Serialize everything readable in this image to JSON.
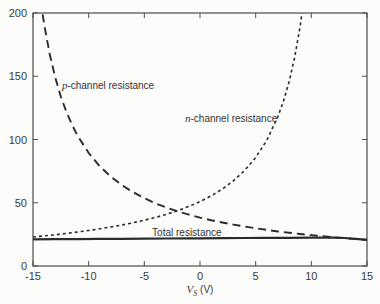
{
  "figure": {
    "background": "#fcfcfb",
    "curve_color": "#2b2b2b",
    "axis_color": "#4d4d4d",
    "text_color": "#3a3a3a"
  },
  "chart_data": {
    "type": "line",
    "title": "",
    "xlabel": "V_S (V)",
    "xlabel_parts": {
      "var": "V",
      "sub": "S",
      "unit": " (V)"
    },
    "ylabel": "",
    "xlim": [
      -15,
      15
    ],
    "ylim": [
      0,
      200
    ],
    "xticks": [
      -15,
      -10,
      -5,
      0,
      5,
      10,
      15
    ],
    "xtick_labels": [
      "-15",
      "-10",
      "-5",
      "0",
      "5",
      "10",
      "15"
    ],
    "yticks": [
      0,
      50,
      100,
      150,
      200
    ],
    "ytick_labels": [
      "0",
      "50",
      "100",
      "150",
      "200"
    ],
    "grid": false,
    "legend": "inline-annotations",
    "tick_direction": "in",
    "mirrored_ticks": true,
    "series": [
      {
        "id": "p-channel-curve",
        "label": "p-channel resistance",
        "line_style": "long-dash",
        "dash": "8 5",
        "stroke_width": 1.9,
        "points": [
          [
            -14.3,
            209
          ],
          [
            -14,
            191.4
          ],
          [
            -13.5,
            167.5
          ],
          [
            -13,
            148.9
          ],
          [
            -12.5,
            134
          ],
          [
            -12,
            121.8
          ],
          [
            -11.5,
            111.7
          ],
          [
            -11,
            103.1
          ],
          [
            -10,
            89.3
          ],
          [
            -9,
            78.8
          ],
          [
            -8,
            70.5
          ],
          [
            -7,
            63.8
          ],
          [
            -6,
            58.3
          ],
          [
            -5,
            53.6
          ],
          [
            -4,
            49.6
          ],
          [
            -3,
            46.2
          ],
          [
            -2,
            43.2
          ],
          [
            -1,
            40.6
          ],
          [
            0,
            38.3
          ],
          [
            1,
            36.2
          ],
          [
            2,
            34.4
          ],
          [
            3,
            32.7
          ],
          [
            4,
            31.2
          ],
          [
            5,
            29.8
          ],
          [
            6,
            28.5
          ],
          [
            7,
            27.3
          ],
          [
            8,
            26.3
          ],
          [
            9,
            25.3
          ],
          [
            10,
            24.4
          ],
          [
            11,
            23.5
          ],
          [
            12,
            22.7
          ],
          [
            13,
            22.0
          ],
          [
            14,
            21.3
          ],
          [
            15,
            20.6
          ]
        ]
      },
      {
        "id": "n-channel-curve",
        "label": "n-channel resistance",
        "line_style": "short-dash",
        "dash": "3 3",
        "stroke_width": 1.6,
        "points": [
          [
            -15,
            22.9
          ],
          [
            -14,
            23.8
          ],
          [
            -13,
            24.7
          ],
          [
            -12,
            25.8
          ],
          [
            -11,
            26.9
          ],
          [
            -10,
            28.1
          ],
          [
            -9,
            29.4
          ],
          [
            -8,
            30.8
          ],
          [
            -7,
            32.4
          ],
          [
            -6,
            34.2
          ],
          [
            -5,
            36.2
          ],
          [
            -4,
            38.4
          ],
          [
            -3,
            40.9
          ],
          [
            -2,
            43.8
          ],
          [
            -1,
            47.1
          ],
          [
            0,
            50.9
          ],
          [
            1,
            55.4
          ],
          [
            2,
            60.8
          ],
          [
            3,
            67.3
          ],
          [
            4,
            75.4
          ],
          [
            5,
            85.8
          ],
          [
            6,
            99.4
          ],
          [
            7,
            118.1
          ],
          [
            7.5,
            130.4
          ],
          [
            8,
            145.6
          ],
          [
            8.5,
            164.7
          ],
          [
            9,
            189.7
          ],
          [
            9.4,
            215.9
          ]
        ]
      },
      {
        "id": "total-curve",
        "label": "Total resistance",
        "line_style": "solid",
        "dash": "",
        "stroke_width": 2.2,
        "points": [
          [
            -15,
            21.1
          ],
          [
            -13,
            21.2
          ],
          [
            -11,
            21.3
          ],
          [
            -9,
            21.4
          ],
          [
            -7,
            21.5
          ],
          [
            -5,
            21.6
          ],
          [
            -3,
            21.7
          ],
          [
            -1,
            21.8
          ],
          [
            0,
            21.9
          ],
          [
            2,
            22.0
          ],
          [
            4,
            22.1
          ],
          [
            6,
            22.2
          ],
          [
            8,
            22.3
          ],
          [
            10,
            22.4
          ],
          [
            12,
            22.4
          ],
          [
            13,
            22.1
          ],
          [
            14,
            21.5
          ],
          [
            15,
            20.7
          ]
        ]
      }
    ],
    "annotations": [
      {
        "italic": "p",
        "text": "-channel resistance",
        "x": -12.4,
        "y": 143,
        "anchor": "start"
      },
      {
        "italic": "n",
        "text": "-channel resistance",
        "x": -1.35,
        "y": 117,
        "anchor": "start"
      },
      {
        "italic": "",
        "text": "Total resistance",
        "x": -4.3,
        "y": 26.5,
        "anchor": "start"
      }
    ]
  }
}
